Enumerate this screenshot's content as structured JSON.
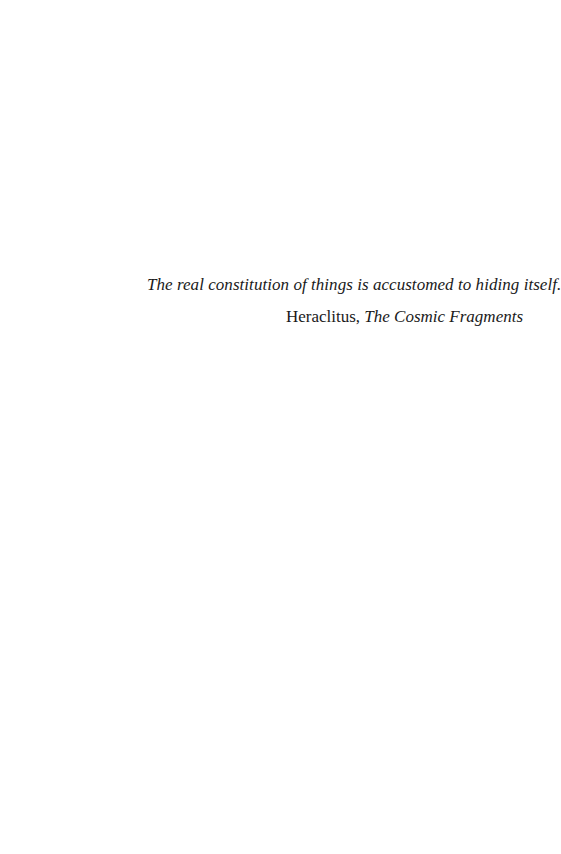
{
  "epigraph": {
    "quote": "The real constitution of things is accustomed to hiding itself.",
    "attribution": {
      "author": "Heraclitus,",
      "work": "The Cosmic Fragments"
    }
  }
}
